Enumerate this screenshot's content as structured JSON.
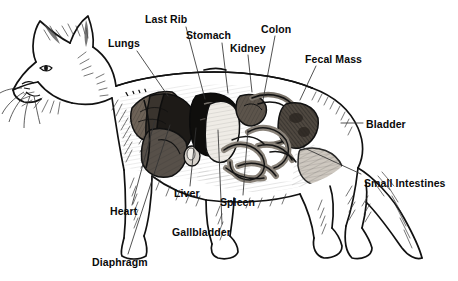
{
  "figure": {
    "background_color": "#ffffff",
    "ink_color": "#111111",
    "label_color": "#0a0a0a"
  },
  "labels": [
    {
      "id": "lungs",
      "text": "Lungs",
      "x": 108,
      "y": 38,
      "line": [
        137,
        51,
        168,
        96
      ]
    },
    {
      "id": "last-rib",
      "text": "Last Rib",
      "x": 145,
      "y": 14,
      "line": [
        186,
        27,
        205,
        99
      ]
    },
    {
      "id": "stomach",
      "text": "Stomach",
      "x": 186,
      "y": 30,
      "line": [
        222,
        43,
        228,
        93
      ]
    },
    {
      "id": "kidney",
      "text": "Kidney",
      "x": 230,
      "y": 43,
      "line": [
        248,
        55,
        252,
        92
      ]
    },
    {
      "id": "colon",
      "text": "Colon",
      "x": 261,
      "y": 24,
      "line": [
        275,
        36,
        263,
        100
      ]
    },
    {
      "id": "fecal-mass",
      "text": "Fecal Mass",
      "x": 305,
      "y": 54,
      "line": [
        316,
        66,
        300,
        100
      ]
    },
    {
      "id": "bladder",
      "text": "Bladder",
      "x": 366,
      "y": 119,
      "line": [
        341,
        123,
        363,
        123
      ]
    },
    {
      "id": "small-intestines",
      "text": "Small Intestines",
      "x": 364,
      "y": 178,
      "line": [
        300,
        146,
        361,
        174
      ]
    },
    {
      "id": "heart",
      "text": "Heart",
      "x": 110,
      "y": 206,
      "line": [
        132,
        205,
        155,
        120
      ]
    },
    {
      "id": "diaphragm",
      "text": "Diaphragm",
      "x": 92,
      "y": 257,
      "line": [
        128,
        254,
        170,
        125
      ]
    },
    {
      "id": "liver",
      "text": "Liver",
      "x": 174,
      "y": 188,
      "line": [
        190,
        186,
        196,
        128
      ]
    },
    {
      "id": "gallbladder",
      "text": "Gallbladder",
      "x": 172,
      "y": 227,
      "line": [
        222,
        224,
        218,
        130
      ]
    },
    {
      "id": "spleen",
      "text": "Spleen",
      "x": 220,
      "y": 197,
      "line": [
        243,
        195,
        248,
        130
      ]
    }
  ]
}
